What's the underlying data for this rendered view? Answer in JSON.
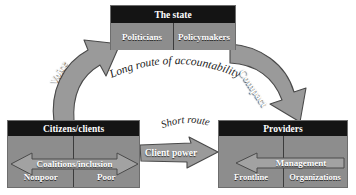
{
  "diagram": {
    "nodes": {
      "state": {
        "header": "The state",
        "cells": [
          "Politicians",
          "Policymakers"
        ]
      },
      "citizens": {
        "header": "Citizens/clients",
        "arrow_label": "Coalitions/inclusion",
        "cells": [
          "Nonpoor",
          "Poor"
        ]
      },
      "providers": {
        "header": "Providers",
        "arrow_label": "Management",
        "cells": [
          "Frontline",
          "Organizations"
        ]
      }
    },
    "routes": {
      "voice": "Voice",
      "compact": "Compact",
      "long_route": "Long route of accountability",
      "short_route": "Short route",
      "client_power": "Client power"
    },
    "colors": {
      "header_fill": "#141414",
      "body_fill": "#8d8d8d",
      "arrow_fill": "#9a9a9a",
      "arrow_stroke": "#4a4a4a",
      "text_light": "#ffffff",
      "text_dark": "#1c1c1c",
      "background": "#ffffff"
    }
  }
}
